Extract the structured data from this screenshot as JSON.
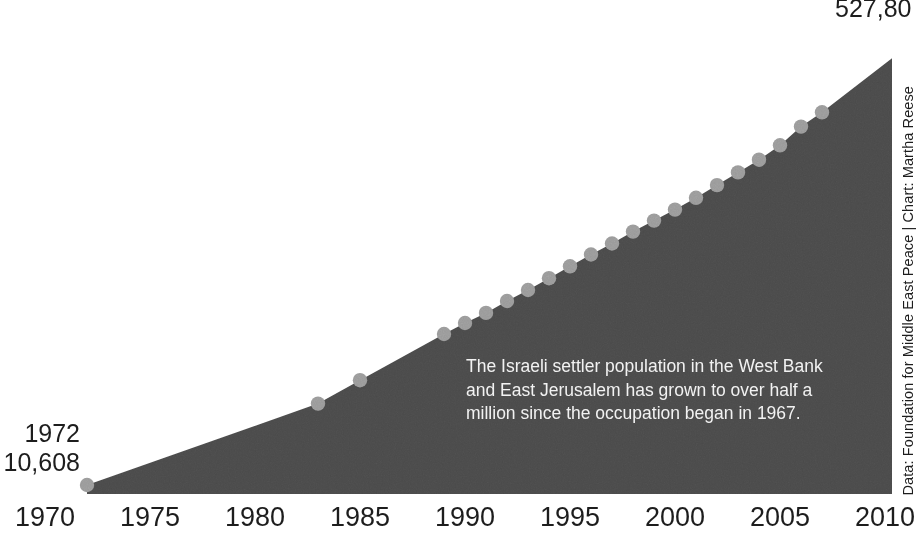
{
  "chart_data": {
    "type": "area",
    "title": "",
    "subtitle": "",
    "xlabel": "",
    "ylabel": "",
    "xlim": [
      1970,
      2011.5
    ],
    "ylim": [
      0,
      560000
    ],
    "grid": false,
    "legend": null,
    "series_name": "Israeli settler population in the West Bank and East Jerusalem",
    "x": [
      1972,
      1983,
      1985,
      1989,
      1990,
      1991,
      1992,
      1993,
      1994,
      1995,
      1996,
      1997,
      1998,
      1999,
      2000,
      2001,
      2002,
      2003,
      2004,
      2005,
      2006,
      2007,
      2011
    ],
    "values": [
      10608,
      106800,
      134400,
      189000,
      202000,
      214000,
      228000,
      241000,
      255000,
      269000,
      283000,
      296000,
      310000,
      323000,
      336000,
      350000,
      365000,
      380000,
      395000,
      412000,
      434000,
      451000,
      527800
    ],
    "xticks": [
      1970,
      1975,
      1980,
      1985,
      1990,
      1995,
      2000,
      2005,
      2010
    ],
    "xtick_labels": [
      "1970",
      "1975",
      "1980",
      "1985",
      "1990",
      "1995",
      "2000",
      "2005",
      "2010"
    ],
    "first_point": {
      "year": "1972",
      "value": "10,608"
    },
    "last_point": {
      "year": "2011",
      "value": "527,800",
      "label_visible": "527,80"
    },
    "colors": {
      "area_fill": "#4a4a4a",
      "marker": "#9a9a9a",
      "background": "#ffffff",
      "axis_text": "#1d1d1d",
      "annotation_text": "#f2f2f2"
    }
  },
  "callouts": {
    "start": {
      "year": "1972",
      "value": "10,608"
    },
    "end": {
      "value": "527,80"
    }
  },
  "annotation": {
    "lines": [
      "The Israeli settler population in the West Bank",
      "and East Jerusalem has grown to over half a",
      "million since the occupation began in 1967."
    ]
  },
  "credit": {
    "text": "Data: Foundation for Middle East Peace | Chart: Martha Reese"
  }
}
